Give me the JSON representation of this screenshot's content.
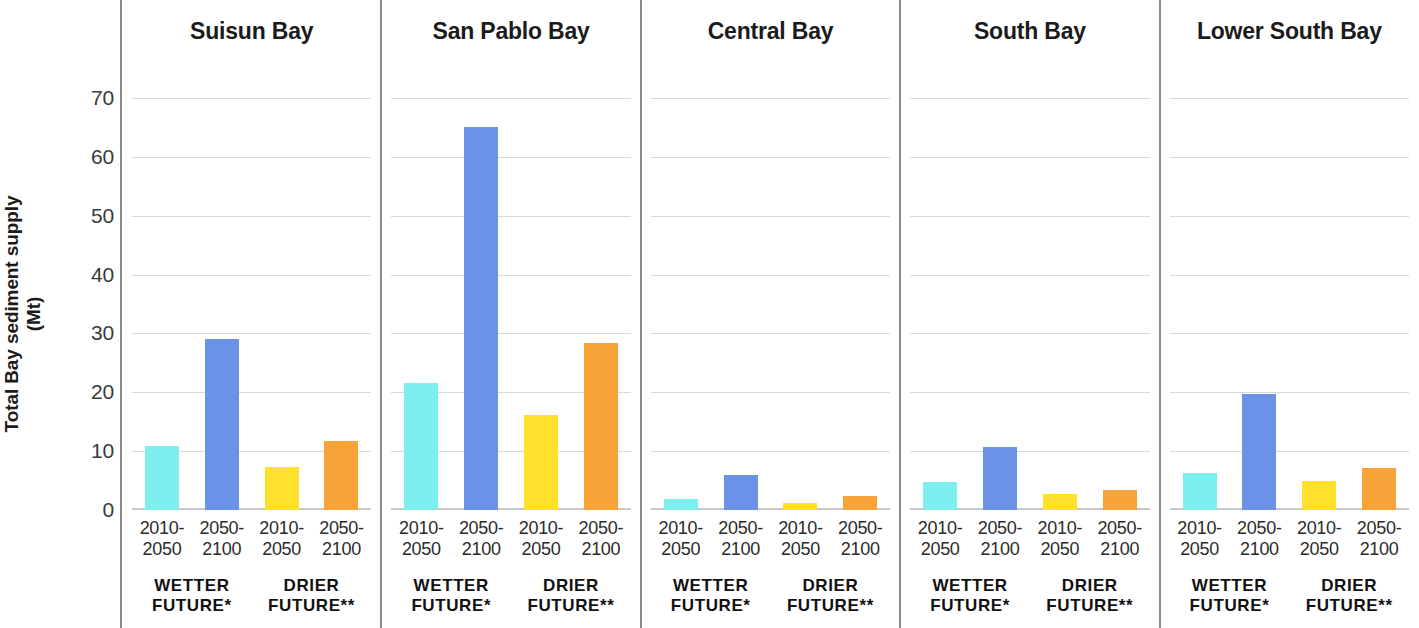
{
  "axis": {
    "y_label_line1": "Total Bay sediment supply",
    "y_label_line2": "(Mt)",
    "y_ticks": [
      "70",
      "60",
      "50",
      "40",
      "30",
      "20",
      "10",
      "0"
    ]
  },
  "colors": {
    "wetter_2010_2050": "#7EEFEF",
    "wetter_2050_2100": "#6A93E8",
    "drier_2010_2050": "#FFE12C",
    "drier_2050_2100": "#F8A338",
    "gridline": "#d8d8d8",
    "divider": "#8b8b8b",
    "text": "#1b1b1b"
  },
  "period_labels": {
    "early_line1": "2010-",
    "early_line2": "2050",
    "late_line1": "2050-",
    "late_line2": "2100"
  },
  "scenario_labels": {
    "wetter_line1": "WETTER",
    "wetter_line2": "FUTURE*",
    "drier_line1": "DRIER",
    "drier_line2": "FUTURE**"
  },
  "chart_data": {
    "type": "bar",
    "title": "",
    "xlabel": "",
    "ylabel": "Total Bay sediment supply (Mt)",
    "ylim": [
      0,
      74
    ],
    "y_ticks": [
      0,
      10,
      20,
      30,
      40,
      50,
      60,
      70
    ],
    "grid": true,
    "legend": "none",
    "panel_layout": "small-multiples, 5 panels left to right",
    "categories": [
      "2010-2050",
      "2050-2100",
      "2010-2050",
      "2050-2100"
    ],
    "category_groups": [
      "WETTER FUTURE*",
      "WETTER FUTURE*",
      "DRIER FUTURE**",
      "DRIER FUTURE**"
    ],
    "panels": [
      {
        "name": "Suisun Bay",
        "bars": [
          {
            "label": "2010-2050",
            "group": "WETTER FUTURE*",
            "value": 10.8,
            "color": "#7EEFEF"
          },
          {
            "label": "2050-2100",
            "group": "WETTER FUTURE*",
            "value": 29.0,
            "color": "#6A93E8"
          },
          {
            "label": "2010-2050",
            "group": "DRIER FUTURE**",
            "value": 7.3,
            "color": "#FFE12C"
          },
          {
            "label": "2050-2100",
            "group": "DRIER FUTURE**",
            "value": 11.8,
            "color": "#F8A338"
          }
        ]
      },
      {
        "name": "San Pablo Bay",
        "bars": [
          {
            "label": "2010-2050",
            "group": "WETTER FUTURE*",
            "value": 21.6,
            "color": "#7EEFEF"
          },
          {
            "label": "2050-2100",
            "group": "WETTER FUTURE*",
            "value": 65.0,
            "color": "#6A93E8"
          },
          {
            "label": "2010-2050",
            "group": "DRIER FUTURE**",
            "value": 16.2,
            "color": "#FFE12C"
          },
          {
            "label": "2050-2100",
            "group": "DRIER FUTURE**",
            "value": 28.3,
            "color": "#F8A338"
          }
        ]
      },
      {
        "name": "Central Bay",
        "bars": [
          {
            "label": "2010-2050",
            "group": "WETTER FUTURE*",
            "value": 1.9,
            "color": "#7EEFEF"
          },
          {
            "label": "2050-2100",
            "group": "WETTER FUTURE*",
            "value": 5.9,
            "color": "#6A93E8"
          },
          {
            "label": "2010-2050",
            "group": "DRIER FUTURE**",
            "value": 1.2,
            "color": "#FFE12C"
          },
          {
            "label": "2050-2100",
            "group": "DRIER FUTURE**",
            "value": 2.3,
            "color": "#F8A338"
          }
        ]
      },
      {
        "name": "South Bay",
        "bars": [
          {
            "label": "2010-2050",
            "group": "WETTER FUTURE*",
            "value": 4.7,
            "color": "#7EEFEF"
          },
          {
            "label": "2050-2100",
            "group": "WETTER FUTURE*",
            "value": 10.7,
            "color": "#6A93E8"
          },
          {
            "label": "2010-2050",
            "group": "DRIER FUTURE**",
            "value": 2.8,
            "color": "#FFE12C"
          },
          {
            "label": "2050-2100",
            "group": "DRIER FUTURE**",
            "value": 3.4,
            "color": "#F8A338"
          }
        ]
      },
      {
        "name": "Lower South Bay",
        "bars": [
          {
            "label": "2010-2050",
            "group": "WETTER FUTURE*",
            "value": 6.3,
            "color": "#7EEFEF"
          },
          {
            "label": "2050-2100",
            "group": "WETTER FUTURE*",
            "value": 19.7,
            "color": "#6A93E8"
          },
          {
            "label": "2010-2050",
            "group": "DRIER FUTURE**",
            "value": 5.0,
            "color": "#FFE12C"
          },
          {
            "label": "2050-2100",
            "group": "DRIER FUTURE**",
            "value": 7.1,
            "color": "#F8A338"
          }
        ]
      }
    ]
  }
}
